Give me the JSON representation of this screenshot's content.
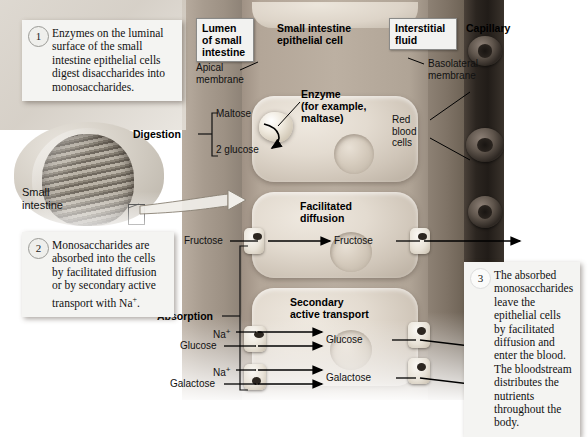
{
  "compartments": {
    "lumen": "Lumen\nof small\nintestine",
    "lumen_line1": "Lumen",
    "lumen_line2": "of small",
    "lumen_line3": "intestine",
    "epithelial_line1": "Small intestine",
    "epithelial_line2": "epithelial cell",
    "interstitial_line1": "Interstitial",
    "interstitial_line2": "fluid",
    "capillary": "Capillary"
  },
  "membranes": {
    "apical_line1": "Apical",
    "apical_line2": "membrane",
    "basolateral_line1": "Basolateral",
    "basolateral_line2": "membrane"
  },
  "brackets": {
    "digestion": "Digestion",
    "absorption": "Absorption"
  },
  "digestion": {
    "substrate": "Maltose",
    "product": "2 glucose",
    "enzyme_line1": "Enzyme",
    "enzyme_line2": "(for example,",
    "enzyme_line3": "maltase)"
  },
  "blood": {
    "rbc_line1": "Red",
    "rbc_line2": "blood",
    "rbc_line3": "cells"
  },
  "transport": [
    {
      "mechanism_line1": "Facilitated",
      "mechanism_line2": "diffusion",
      "lumen_label": "Fructose",
      "cell_label": "Fructose",
      "cotransport_ion": ""
    },
    {
      "mechanism_line1": "Secondary",
      "mechanism_line2": "active transport",
      "lumen_label": "Glucose",
      "cell_label": "Glucose",
      "cotransport_ion": "Na",
      "cotransport_ion_charge": "+"
    },
    {
      "lumen_label": "Galactose",
      "cell_label": "Galactose",
      "cotransport_ion": "Na",
      "cotransport_ion_charge": "+"
    }
  ],
  "organ": {
    "label_line1": "Small",
    "label_line2": "intestine"
  },
  "steps": [
    {
      "number": "1",
      "text": "Enzymes on the luminal surface of the small intestine epithelial cells digest disaccharides into monosaccharides."
    },
    {
      "number": "2",
      "text_part1": "Monosaccharides are absorbed into the cells by facilitated diffusion or by secondary active transport with Na",
      "text_sup": "+",
      "text_part2": "."
    },
    {
      "number": "3",
      "text": "The absorbed monosaccharides leave the epithelial cells by facilitated diffusion and enter the blood. The bloodstream distributes the nutrients throughout the body."
    }
  ],
  "colors": {
    "lumen": "#a89c8f",
    "epithelial": "#bcb0a2",
    "interstitial": "#7e7265",
    "capillary": "#2b2520",
    "callout_bg": "#f4f4f2",
    "text": "#111111",
    "arrow": "#000000"
  }
}
